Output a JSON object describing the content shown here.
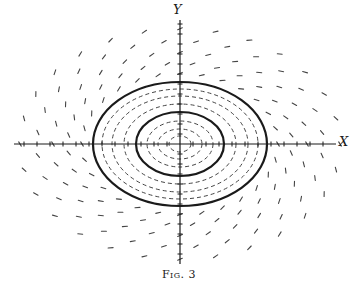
{
  "figure": {
    "caption": "Fig. 3",
    "x_axis_label": "X",
    "y_axis_label": "Y",
    "ink_color": "#1a1a1a",
    "dash_color": "#444444",
    "background": "#ffffff"
  },
  "geometry": {
    "center": [
      180,
      144
    ],
    "x_axis": {
      "from": 14,
      "to": 336,
      "tick_spacing": 13
    },
    "y_axis": {
      "from": 20,
      "to": 264,
      "tick_spacing": 10
    },
    "solid_cycles": [
      {
        "name": "outer-limit-cycle",
        "rx": 87,
        "ry": 62
      },
      {
        "name": "inner-limit-cycle",
        "rx": 44,
        "ry": 32
      }
    ],
    "dashed_orbits": [
      {
        "rx": 11,
        "ry": 8
      },
      {
        "rx": 22,
        "ry": 15
      },
      {
        "rx": 33,
        "ry": 23
      },
      {
        "rx": 56,
        "ry": 40
      },
      {
        "rx": 68,
        "ry": 48
      },
      {
        "rx": 78,
        "ry": 55
      }
    ],
    "direction_field": {
      "rings": [
        98,
        112,
        127,
        143,
        160
      ],
      "aspect": 0.72,
      "spokes": 28,
      "dash_length": 5
    }
  }
}
